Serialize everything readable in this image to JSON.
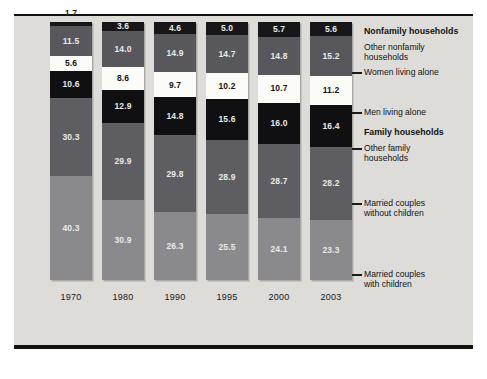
{
  "chart_data": {
    "type": "bar",
    "subtype": "stacked-100-percent",
    "title": "",
    "xlabel": "",
    "ylabel": "",
    "ylim": [
      0,
      100
    ],
    "grid": false,
    "legend_position": "right-callout",
    "categories": [
      "1970",
      "1980",
      "1990",
      "1995",
      "2000",
      "2003"
    ],
    "series": [
      {
        "name": "Other nonfamily households",
        "group": "Nonfamily households",
        "color": "#17171a",
        "values": [
          1.7,
          3.6,
          4.6,
          5.0,
          5.7,
          5.6
        ]
      },
      {
        "name": "Women living alone",
        "group": "Nonfamily households",
        "color": "#57575c",
        "values": [
          11.5,
          14.0,
          14.9,
          14.7,
          14.8,
          15.2
        ]
      },
      {
        "name": "Men living alone",
        "group": "Nonfamily households",
        "color": "#fbfbf8",
        "values": [
          5.6,
          8.6,
          9.7,
          10.2,
          10.7,
          11.2
        ]
      },
      {
        "name": "Other family households",
        "group": "Family households",
        "color": "#100f12",
        "values": [
          10.6,
          12.9,
          14.8,
          15.6,
          16.0,
          16.4
        ]
      },
      {
        "name": "Married couples without children",
        "group": "Family households",
        "color": "#5e5e62",
        "values": [
          30.3,
          29.9,
          29.8,
          28.9,
          28.7,
          28.2
        ]
      },
      {
        "name": "Married couples with children",
        "group": "Family households",
        "color": "#8a8a8d",
        "values": [
          40.3,
          30.9,
          26.3,
          25.5,
          24.1,
          23.3
        ]
      }
    ]
  },
  "legend": {
    "group_nonfamily": "Nonfamily households",
    "group_family": "Family households",
    "items": [
      {
        "label_line1": "Other nonfamily",
        "label_line2": "households"
      },
      {
        "label_line1": "Women living alone",
        "label_line2": ""
      },
      {
        "label_line1": "Men living alone",
        "label_line2": ""
      },
      {
        "label_line1": "Other family",
        "label_line2": "households"
      },
      {
        "label_line1": "Married couples",
        "label_line2": "without children"
      },
      {
        "label_line1": "Married couples",
        "label_line2": "with children"
      }
    ]
  }
}
